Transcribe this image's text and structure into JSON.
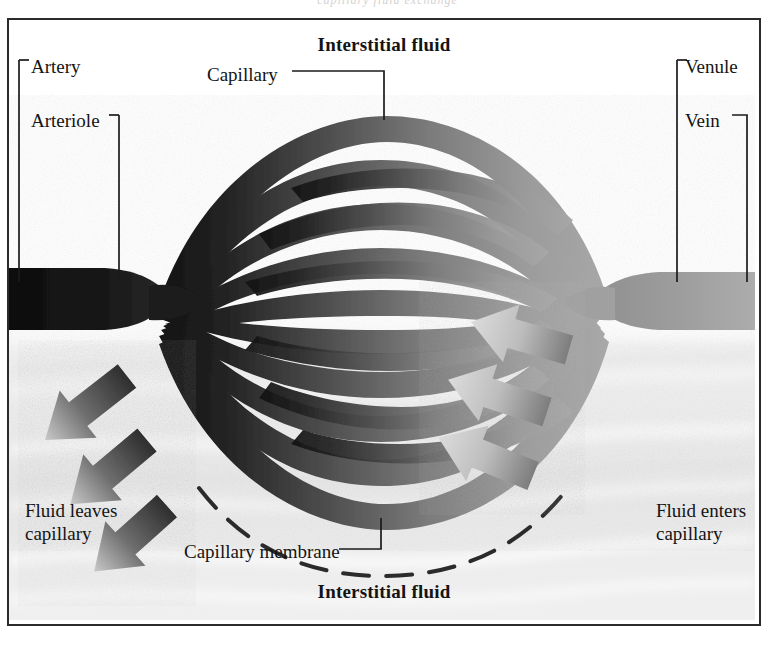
{
  "page": {
    "top_bleed_text": "capillary fluid exchange",
    "background_color": "#ffffff",
    "frame_color": "#2b2b2b"
  },
  "figure": {
    "title_top": "Interstitial fluid",
    "title_bottom": "Interstitial fluid",
    "labels": {
      "capillary": "Capillary",
      "artery": "Artery",
      "arteriole": "Arteriole",
      "venule": "Venule",
      "vein": "Vein",
      "capillary_membrane": "Capillary membrane",
      "fluid_leaves": "Fluid leaves capillary",
      "fluid_enters": "Fluid enters capillary"
    },
    "colors": {
      "arterial_dark": "#1d1d1d",
      "venous_light": "#9a9a9a",
      "vessel_mid": "#6e6e6e",
      "arrow_out_dark": "#3a3a3a",
      "arrow_in_light": "#b4b4b4",
      "membrane_dash": "#2b2b2b",
      "interstitium_wash": "#e8e8e8"
    },
    "arrows": {
      "outward_count": 3,
      "outward_direction": "down-left",
      "inward_count": 3,
      "inward_direction": "up-left"
    },
    "vessel_rows": 11,
    "membrane_style": "dashed arc beneath capillary bed"
  }
}
